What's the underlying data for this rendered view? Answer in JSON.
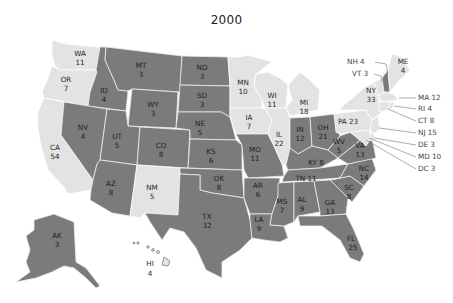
{
  "title": "2000",
  "colors": {
    "party_dark": "#7b7b7b",
    "party_light": "#e3e3e3",
    "background": "#ffffff"
  },
  "states": {
    "WA": {
      "abbr": "WA",
      "votes": "11",
      "shade": "light"
    },
    "OR": {
      "abbr": "OR",
      "votes": "7",
      "shade": "light"
    },
    "CA": {
      "abbr": "CA",
      "votes": "54",
      "shade": "light"
    },
    "ID": {
      "abbr": "ID",
      "votes": "4",
      "shade": "dark"
    },
    "NV": {
      "abbr": "NV",
      "votes": "4",
      "shade": "dark"
    },
    "MT": {
      "abbr": "MT",
      "votes": "3",
      "shade": "dark"
    },
    "WY": {
      "abbr": "WY",
      "votes": "3",
      "shade": "dark"
    },
    "UT": {
      "abbr": "UT",
      "votes": "5",
      "shade": "dark"
    },
    "CO": {
      "abbr": "CO",
      "votes": "8",
      "shade": "dark"
    },
    "AZ": {
      "abbr": "AZ",
      "votes": "8",
      "shade": "dark"
    },
    "NM": {
      "abbr": "NM",
      "votes": "5",
      "shade": "light"
    },
    "ND": {
      "abbr": "ND",
      "votes": "3",
      "shade": "dark"
    },
    "SD": {
      "abbr": "SD",
      "votes": "3",
      "shade": "dark"
    },
    "NE": {
      "abbr": "NE",
      "votes": "5",
      "shade": "dark"
    },
    "KS": {
      "abbr": "KS",
      "votes": "6",
      "shade": "dark"
    },
    "OK": {
      "abbr": "OK",
      "votes": "8",
      "shade": "dark"
    },
    "TX": {
      "abbr": "TX",
      "votes": "32",
      "shade": "dark"
    },
    "MN": {
      "abbr": "MN",
      "votes": "10",
      "shade": "light"
    },
    "IA": {
      "abbr": "IA",
      "votes": "7",
      "shade": "light"
    },
    "MO": {
      "abbr": "MO",
      "votes": "11",
      "shade": "dark"
    },
    "AR": {
      "abbr": "AR",
      "votes": "6",
      "shade": "dark"
    },
    "LA": {
      "abbr": "LA",
      "votes": "9",
      "shade": "dark"
    },
    "WI": {
      "abbr": "WI",
      "votes": "11",
      "shade": "light"
    },
    "IL": {
      "abbr": "IL",
      "votes": "22",
      "shade": "light"
    },
    "MI": {
      "abbr": "MI",
      "votes": "18",
      "shade": "light"
    },
    "IN": {
      "abbr": "IN",
      "votes": "12",
      "shade": "dark"
    },
    "OH": {
      "abbr": "OH",
      "votes": "21",
      "shade": "dark"
    },
    "KY": {
      "abbr": "KY",
      "votes": "8",
      "shade": "dark"
    },
    "TN": {
      "abbr": "TN",
      "votes": "11",
      "shade": "dark"
    },
    "MS": {
      "abbr": "MS",
      "votes": "7",
      "shade": "dark"
    },
    "AL": {
      "abbr": "AL",
      "votes": "9",
      "shade": "dark"
    },
    "GA": {
      "abbr": "GA",
      "votes": "13",
      "shade": "dark"
    },
    "FL": {
      "abbr": "FL",
      "votes": "25",
      "shade": "dark"
    },
    "SC": {
      "abbr": "SC",
      "votes": "8",
      "shade": "dark"
    },
    "NC": {
      "abbr": "NC",
      "votes": "14",
      "shade": "dark"
    },
    "VA": {
      "abbr": "VA",
      "votes": "13",
      "shade": "dark"
    },
    "WV": {
      "abbr": "WV",
      "votes": "5",
      "shade": "dark"
    },
    "PA": {
      "abbr": "PA",
      "votes": "23",
      "shade": "light"
    },
    "NY": {
      "abbr": "NY",
      "votes": "33",
      "shade": "light"
    },
    "ME": {
      "abbr": "ME",
      "votes": "4",
      "shade": "light"
    },
    "NH": {
      "abbr": "NH",
      "votes": "4",
      "shade": "dark"
    },
    "VT": {
      "abbr": "VT",
      "votes": "3",
      "shade": "light"
    },
    "MA": {
      "abbr": "MA",
      "votes": "12",
      "shade": "light"
    },
    "RI": {
      "abbr": "RI",
      "votes": "4",
      "shade": "light"
    },
    "CT": {
      "abbr": "CT",
      "votes": "8",
      "shade": "light"
    },
    "NJ": {
      "abbr": "NJ",
      "votes": "15",
      "shade": "light"
    },
    "DE": {
      "abbr": "DE",
      "votes": "3",
      "shade": "light"
    },
    "MD": {
      "abbr": "MD",
      "votes": "10",
      "shade": "light"
    },
    "DC": {
      "abbr": "DC",
      "votes": "3",
      "shade": "light"
    },
    "AK": {
      "abbr": "AK",
      "votes": "3",
      "shade": "dark"
    },
    "HI": {
      "abbr": "HI",
      "votes": "4",
      "shade": "light"
    }
  },
  "callouts": {
    "NH": "NH 4",
    "VT": "VT 3",
    "MA": "MA 12",
    "RI": "RI 4",
    "CT": "CT 8",
    "NJ": "NJ 15",
    "DE": "DE 3",
    "MD": "MD 10",
    "DC": "DC 3"
  }
}
